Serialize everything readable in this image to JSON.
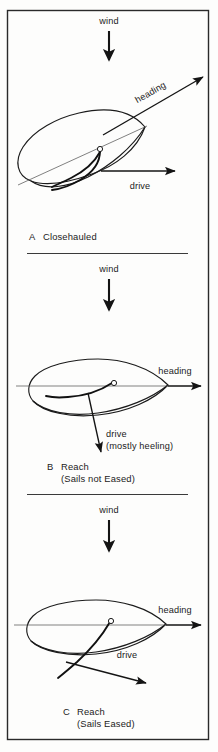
{
  "figure": {
    "background_color": "#fdfdfc",
    "ink_color": "#1b1b1b",
    "frame": {
      "x": 7,
      "y": 10,
      "width": 202,
      "height": 730
    }
  },
  "panels": [
    {
      "id": "a",
      "letter": "A",
      "caption": "Closehauled",
      "caption_line2": "",
      "wind_label": "wind",
      "heading_label": "heading",
      "drive_label": "drive",
      "drive_sub_label": "",
      "heading_rotated": true,
      "heading_angle_deg": -27,
      "boat_rotation_deg": -27,
      "notes": "Boat sailing closehauled; drive vector points forward and to the right, heading diagonal up-right."
    },
    {
      "id": "b",
      "letter": "B",
      "caption": "Reach",
      "caption_line2": "(Sails not Eased)",
      "wind_label": "wind",
      "heading_label": "heading",
      "drive_label": "drive",
      "drive_sub_label": "(mostly heeling)",
      "heading_rotated": false,
      "heading_angle_deg": 0,
      "boat_rotation_deg": 0,
      "notes": "Boat on a reach with sails sheeted in; force vector points down-left, mostly heeling rather than driving."
    },
    {
      "id": "c",
      "letter": "C",
      "caption": "Reach",
      "caption_line2": "(Sails Eased)",
      "wind_label": "wind",
      "heading_label": "heading",
      "drive_label": "drive",
      "drive_sub_label": "",
      "heading_rotated": false,
      "heading_angle_deg": 0,
      "boat_rotation_deg": 0,
      "notes": "Boat on a reach with sails eased; drive vector points forward along the heading."
    }
  ],
  "dividers": [
    {
      "y": 253,
      "x1": 27,
      "x2": 188
    },
    {
      "y": 494,
      "x1": 27,
      "x2": 188
    }
  ]
}
